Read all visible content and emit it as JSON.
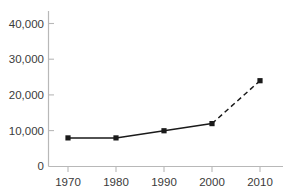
{
  "chart_data": {
    "type": "line",
    "title": "",
    "xlabel": "",
    "ylabel": "",
    "x": [
      1970,
      1980,
      1990,
      2000,
      2010
    ],
    "categories": [
      "1970",
      "1980",
      "1990",
      "2000",
      "2010"
    ],
    "values": [
      8000,
      8000,
      10000,
      12000,
      24000
    ],
    "series": [
      {
        "name": "observed",
        "style": "solid",
        "x": [
          1970,
          1980,
          1990,
          2000
        ],
        "values": [
          8000,
          8000,
          10000,
          12000
        ]
      },
      {
        "name": "projected",
        "style": "dashed",
        "x": [
          2000,
          2010
        ],
        "values": [
          12000,
          24000
        ]
      }
    ],
    "xlim": [
      1965,
      2015
    ],
    "ylim": [
      0,
      40000
    ],
    "xticks": [
      1970,
      1980,
      1990,
      2000,
      2010
    ],
    "yticks": [
      0,
      10000,
      20000,
      30000,
      40000
    ],
    "xtick_labels": [
      "1970",
      "1980",
      "1990",
      "2000",
      "2010"
    ],
    "ytick_labels": [
      "0",
      "10,000",
      "20,000",
      "30,000",
      "40,000"
    ],
    "grid": false,
    "legend": "none",
    "marker": "square",
    "colors": {
      "line": "#1a1a1a",
      "marker": "#1a1a1a",
      "axis": "#b8b8b8",
      "text": "#3a3a3a",
      "background": "#ffffff"
    }
  },
  "axes": {
    "y_labels": {
      "t40000": "40,000",
      "t30000": "30,000",
      "t20000": "20,000",
      "t10000": "10,000",
      "t0": "0"
    },
    "x_labels": {
      "t1970": "1970",
      "t1980": "1980",
      "t1990": "1990",
      "t2000": "2000",
      "t2010": "2010"
    }
  }
}
